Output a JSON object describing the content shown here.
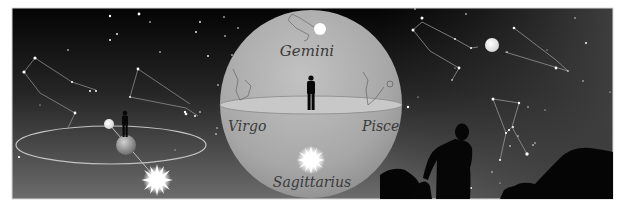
{
  "figure": {
    "colors": {
      "frame_border": "#d8d8d8",
      "sky_top": "#050505",
      "sky_bottom": "#6a6a6a",
      "sky_right": "#3c3c3c",
      "sphere_fill": "#a9a9a9",
      "sphere_highlight": "#c4c4c4",
      "horizon_plane": "#c9c9c9",
      "orbit_line": "#bdbdbd",
      "constellation_line": "#9a9a9a",
      "label_text": "#3a3a3a",
      "silhouette": "#050505",
      "sun": "#ffffff",
      "moon": "#f2f2f2"
    },
    "labels": {
      "top": "Gemini",
      "left": "Virgo",
      "right": "Pisces",
      "bottom": "Sagittarius"
    },
    "panels": [
      {
        "name": "orbit-panel",
        "content": "Earth with standing observer on a circular orbit, small moon, and radiant Sun below"
      },
      {
        "name": "celestial-sphere-panel",
        "content": "Observer on horizon plane inside celestial sphere with zodiac labels"
      },
      {
        "name": "night-sky-panel",
        "content": "Silhouetted person on rocky landscape viewing constellations and full moon"
      }
    ]
  }
}
